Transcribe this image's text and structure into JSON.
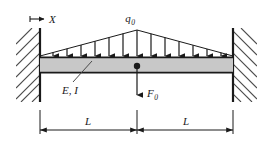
{
  "figure": {
    "name": "fixed-fixed-beam-loading-diagram",
    "type": "structural-engineering-free-body-diagram",
    "background_color": "#ffffff",
    "line_color": "#1a1a1a",
    "beam_fill_color": "#c8c8c8",
    "hatch_color": "#4a4a4a"
  },
  "labels": {
    "axis": {
      "symbol": "X",
      "icon": "right-arrow-with-origin-tick"
    },
    "distributed_load": {
      "symbol": "q",
      "subscript": "0"
    },
    "point_load": {
      "symbol": "F",
      "subscript": "0"
    },
    "material": {
      "text": "E, I"
    },
    "dimension_left": {
      "symbol": "L"
    },
    "dimension_right": {
      "symbol": "L"
    }
  },
  "geometry": {
    "beam": {
      "left_x": 40,
      "right_x": 233,
      "top_y": 57,
      "bottom_y": 73,
      "center_x": 137
    },
    "supports": {
      "left_wall_x": 40,
      "right_wall_x": 233,
      "wall_top_y": 28,
      "wall_bottom_y": 102,
      "hatch_count": 8,
      "hatch_angle_deg": 45
    },
    "triangular_load": {
      "apex_x": 137,
      "apex_y": 30,
      "base_y": 56,
      "arrow_count": 13,
      "shape": "isosceles-triangle-peak-at-midspan"
    },
    "point_load_arrow": {
      "x": 137,
      "from_y": 66,
      "to_y": 96,
      "direction": "down",
      "marker": "filled-circle-on-beam"
    },
    "dimension_line": {
      "y": 130,
      "left_x": 40,
      "mid_x": 137,
      "right_x": 233,
      "extension_top_y": 110
    }
  }
}
